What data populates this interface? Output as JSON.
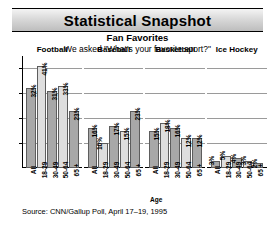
{
  "header": {
    "title": "Statistical Snapshot",
    "subtitle": "Fan Favorites",
    "question": "We asked \"What's your favorite sport?\""
  },
  "footer": {
    "source": "Source: CNN/Gallup Poll, April 17–19, 1995",
    "xlabel": "Age"
  },
  "colors": {
    "bar_dark": "#a8a8a8",
    "bar_light": "#dedede",
    "bar_border": "#5d5d5d",
    "gridline": "#9a9a9a",
    "axis": "#000000",
    "banner_from": "#f4f4f4",
    "banner_to": "#bdbdbd"
  },
  "chart_data": {
    "type": "bar",
    "title": "Fan Favorites",
    "subtitle": "We asked \"What's your favorite sport?\"",
    "xlabel": "Age",
    "ylabel": "",
    "ylim": [
      0,
      45
    ],
    "grid": true,
    "legend": "none",
    "gridlines": [
      10,
      20,
      30,
      40
    ],
    "categories": [
      "All",
      "18-29",
      "30-49",
      "50-64",
      "65 +"
    ],
    "panels": [
      {
        "name": "Football",
        "values": [
          32,
          41,
          31,
          33,
          23
        ],
        "labels": [
          "32%",
          "41%",
          "31%",
          "33%",
          "23%"
        ],
        "shades": [
          "dark",
          "light",
          "dark",
          "light",
          "dark"
        ]
      },
      {
        "name": "Baseball",
        "values": [
          16,
          10,
          17,
          15,
          23
        ],
        "labels": [
          "16%",
          "10%",
          "17%",
          "15%",
          "23%"
        ],
        "shades": [
          "dark",
          "light",
          "dark",
          "light",
          "dark"
        ]
      },
      {
        "name": "Basketball",
        "values": [
          15,
          18,
          16,
          12,
          12
        ],
        "labels": [
          "15%",
          "18%",
          "16%",
          "12%",
          "12%"
        ],
        "shades": [
          "dark",
          "light",
          "dark",
          "light",
          "dark"
        ]
      },
      {
        "name": "Ice Hockey",
        "values": [
          3,
          5,
          4,
          3,
          2
        ],
        "labels": [
          "3%",
          "5%",
          "4%",
          "3%",
          "2%"
        ],
        "shades": [
          "dark",
          "light",
          "dark",
          "light",
          "dark"
        ]
      }
    ]
  }
}
